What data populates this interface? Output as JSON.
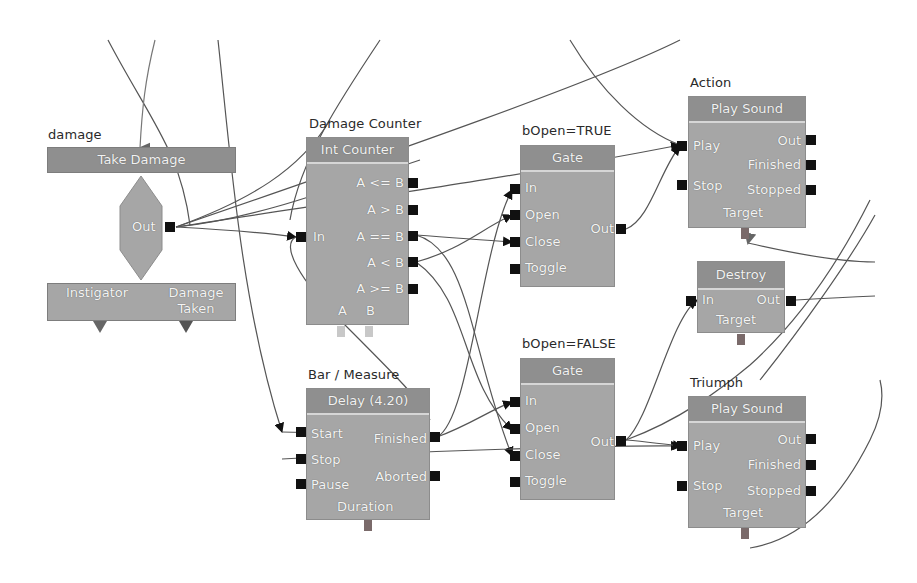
{
  "nodes": {
    "event": {
      "title": "damage",
      "header": "Take Damage",
      "out_label": "Out",
      "vars": [
        "Instigator",
        "Damage\nTaken"
      ]
    },
    "counter": {
      "title": "Damage Counter",
      "header": "Int Counter",
      "in_label": "In",
      "outputs": [
        "A <= B",
        "A > B",
        "A == B",
        "A < B",
        "A >= B"
      ],
      "vars": [
        "A",
        "B"
      ]
    },
    "gate_true": {
      "title": "bOpen=TRUE",
      "header": "Gate",
      "inputs": [
        "In",
        "Open",
        "Close",
        "Toggle"
      ],
      "out_label": "Out"
    },
    "gate_false": {
      "title": "bOpen=FALSE",
      "header": "Gate",
      "inputs": [
        "In",
        "Open",
        "Close",
        "Toggle"
      ],
      "out_label": "Out"
    },
    "action": {
      "title": "Action",
      "header": "Play Sound",
      "inputs": [
        "Play",
        "Stop"
      ],
      "outputs": [
        "Out",
        "Finished",
        "Stopped"
      ],
      "var": "Target"
    },
    "destroy": {
      "header": "Destroy",
      "in_label": "In",
      "out_label": "Out",
      "var": "Target"
    },
    "delay": {
      "title": "Bar / Measure",
      "header": "Delay (4.20)",
      "inputs": [
        "Start",
        "Stop",
        "Pause"
      ],
      "outputs": [
        "Finished",
        "Aborted"
      ],
      "var": "Duration"
    },
    "triumph": {
      "title": "Triumph",
      "header": "Play Sound",
      "inputs": [
        "Play",
        "Stop"
      ],
      "outputs": [
        "Out",
        "Finished",
        "Stopped"
      ],
      "var": "Target"
    }
  },
  "colors": {
    "background": "#ffffff",
    "node_body": "#a6a6a6",
    "node_header": "#8f8f8f",
    "port": "#111111",
    "wire": "#555555",
    "var_port": "#7a6a6a"
  }
}
